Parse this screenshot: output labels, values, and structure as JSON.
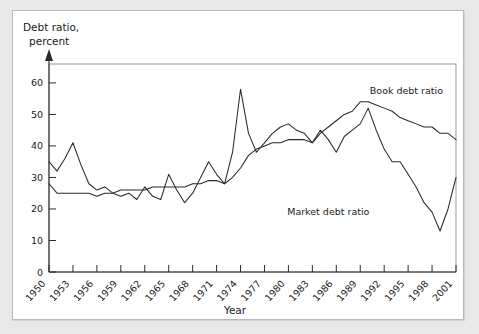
{
  "figure": {
    "ylabel_line1": "Debt ratio,",
    "ylabel_line2": "percent",
    "xlabel": "Year"
  },
  "chart_data": {
    "type": "line",
    "title": "",
    "xlabel": "Year",
    "ylabel": "Debt ratio, percent",
    "xlim": [
      1950,
      2001
    ],
    "ylim": [
      0,
      66
    ],
    "yticks": [
      0,
      10,
      20,
      30,
      40,
      50,
      60
    ],
    "ytick_labels": [
      "0",
      "10",
      "20",
      "30",
      "40",
      "50",
      "60"
    ],
    "xticks": [
      1950,
      1953,
      1956,
      1959,
      1962,
      1965,
      1968,
      1971,
      1974,
      1977,
      1980,
      1983,
      1986,
      1989,
      1992,
      1995,
      1998,
      2001
    ],
    "xtick_labels": [
      "1950",
      "1953",
      "1956",
      "1959",
      "1962",
      "1965",
      "1968",
      "1971",
      "1974",
      "1977",
      "1980",
      "1983",
      "1986",
      "1989",
      "1992",
      "1995",
      "1998",
      "2001"
    ],
    "grid": false,
    "legend_position": "inline-annotation",
    "line_color": "#2a2a2a",
    "annotations": [
      {
        "text": "Book debt ratio",
        "x": 1990.2,
        "y": 56.5
      },
      {
        "text": "Market debt ratio",
        "x": 1985.0,
        "y": 18.0
      }
    ],
    "x": [
      1950,
      1951,
      1952,
      1953,
      1954,
      1955,
      1956,
      1957,
      1958,
      1959,
      1960,
      1961,
      1962,
      1963,
      1964,
      1965,
      1966,
      1967,
      1968,
      1969,
      1970,
      1971,
      1972,
      1973,
      1974,
      1975,
      1976,
      1977,
      1978,
      1979,
      1980,
      1981,
      1982,
      1983,
      1984,
      1985,
      1986,
      1987,
      1988,
      1989,
      1990,
      1991,
      1992,
      1993,
      1994,
      1995,
      1996,
      1997,
      1998,
      1999,
      2000,
      2001
    ],
    "series": [
      {
        "name": "Market debt ratio",
        "values": [
          35,
          32,
          36,
          41,
          34,
          28,
          26,
          27,
          25,
          24,
          25,
          23,
          27,
          24,
          23,
          31,
          26,
          22,
          25,
          30,
          35,
          31,
          28,
          38,
          58,
          44,
          38,
          41,
          44,
          46,
          47,
          45,
          44,
          41,
          45,
          42,
          38,
          43,
          45,
          47,
          52,
          45,
          39,
          35,
          35,
          31,
          27,
          22,
          19,
          13,
          20,
          30
        ]
      },
      {
        "name": "Book debt ratio",
        "values": [
          28,
          25,
          25,
          25,
          25,
          25,
          24,
          25,
          25,
          26,
          26,
          26,
          26,
          27,
          27,
          27,
          27,
          27,
          28,
          28,
          29,
          29,
          28,
          30,
          33,
          37,
          39,
          40,
          41,
          41,
          42,
          42,
          42,
          41,
          44,
          46,
          48,
          50,
          51,
          54,
          54,
          53,
          52,
          51,
          49,
          48,
          47,
          46,
          46,
          44,
          44,
          42
        ]
      }
    ]
  }
}
